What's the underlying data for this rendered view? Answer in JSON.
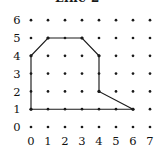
{
  "figure": {
    "title": "Line 2",
    "title_clipped": true,
    "background_color": "#ffffff",
    "ink_color": "#1a1a1a"
  },
  "axes": {
    "x_tick_labels": [
      "0",
      "1",
      "2",
      "3",
      "4",
      "5",
      "6",
      "7"
    ],
    "y_tick_labels": [
      "0",
      "1",
      "2",
      "3",
      "4",
      "5",
      "6"
    ],
    "x_range": [
      0,
      7
    ],
    "y_range": [
      0,
      6
    ],
    "grid_style": "dot-lattice"
  },
  "chart_data": {
    "type": "scatter",
    "title": "Line 2",
    "xlabel": "",
    "ylabel": "",
    "xlim": [
      0,
      7
    ],
    "ylim": [
      0,
      6
    ],
    "grid": true,
    "legend": "none",
    "categories": [
      "0",
      "1",
      "2",
      "3",
      "4",
      "5",
      "6",
      "7"
    ],
    "lattice_points": {
      "x": [
        0,
        1,
        2,
        3,
        4,
        5,
        6,
        7
      ],
      "y": [
        0,
        1,
        2,
        3,
        4,
        5,
        6
      ]
    },
    "series": [
      {
        "name": "polygon",
        "closed": true,
        "x": [
          0,
          0,
          1,
          3,
          4,
          4,
          6
        ],
        "y": [
          1,
          4,
          5,
          5,
          4,
          2,
          1
        ],
        "vertices": [
          [
            0,
            1
          ],
          [
            0,
            4
          ],
          [
            1,
            5
          ],
          [
            3,
            5
          ],
          [
            4,
            4
          ],
          [
            4,
            2
          ],
          [
            6,
            1
          ]
        ]
      }
    ]
  }
}
